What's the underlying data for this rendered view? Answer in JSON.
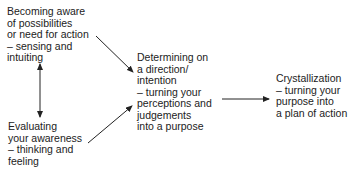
{
  "diagram": {
    "nodes": [
      {
        "id": "aware",
        "text": "Becoming aware\nof possibilities\nor need for action\n– sensing and\nintuiting"
      },
      {
        "id": "evaluate",
        "text": "Evaluating\nyour awareness\n– thinking and\nfeeling"
      },
      {
        "id": "determine",
        "text": "Determining on\na direction/\nintention\n– turning your\nperceptions and\njudgements\ninto a purpose"
      },
      {
        "id": "crystal",
        "text": "Crystallization\n– turning your\npurpose into\na plan of action"
      }
    ],
    "edges": [
      {
        "from": "aware",
        "to": "evaluate",
        "type": "bidirectional"
      },
      {
        "from": "aware",
        "to": "determine",
        "type": "directed"
      },
      {
        "from": "evaluate",
        "to": "determine",
        "type": "directed"
      },
      {
        "from": "determine",
        "to": "crystal",
        "type": "directed"
      }
    ]
  }
}
